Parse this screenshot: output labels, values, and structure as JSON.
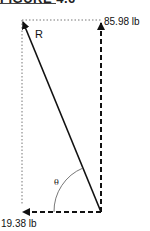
{
  "figure": {
    "title": "FIGURE 4.6"
  },
  "labels": {
    "resultant": "R",
    "vertical_force": "85.98 lb",
    "horizontal_force": "19.38 lb",
    "angle": "θ"
  },
  "colors": {
    "line": "#111111",
    "dotted": "#777777",
    "background": "#ffffff"
  }
}
